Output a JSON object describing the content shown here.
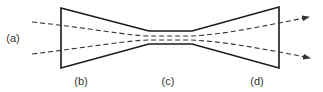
{
  "diagram": {
    "labels": {
      "a": "(a)",
      "b": "(b)",
      "c": "(c)",
      "d": "(d)"
    },
    "colors": {
      "outline": "#1a1a1a",
      "streamline": "#333333",
      "text": "#333333",
      "background": "#ffffff"
    },
    "sections": [
      {
        "id": "b",
        "name": "converging inlet"
      },
      {
        "id": "c",
        "name": "throat"
      },
      {
        "id": "d",
        "name": "diverging outlet"
      }
    ],
    "streamlines": 2,
    "arrow_direction": "left-to-right"
  }
}
